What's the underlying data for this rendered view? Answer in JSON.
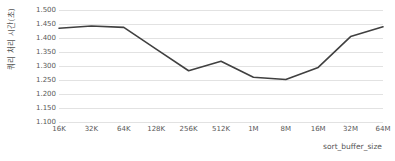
{
  "chart_data": {
    "type": "line",
    "title": "",
    "xlabel": "sort_buffer_size",
    "ylabel": "쿼리 처리 시간(초)",
    "categories": [
      "16K",
      "32K",
      "64K",
      "128K",
      "256K",
      "512K",
      "1M",
      "8M",
      "16M",
      "32M",
      "64M"
    ],
    "values": [
      1.435,
      1.443,
      1.438,
      1.36,
      1.283,
      1.317,
      1.26,
      1.252,
      1.295,
      1.405,
      1.44
    ],
    "series": [
      {
        "name": "쿼리 처리 시간(초)",
        "values": [
          1.435,
          1.443,
          1.438,
          1.36,
          1.283,
          1.317,
          1.26,
          1.252,
          1.295,
          1.405,
          1.44
        ]
      }
    ],
    "ylim": [
      1.1,
      1.5
    ],
    "ytick_step": 0.05,
    "ytick_labels": [
      "1.500",
      "1.450",
      "1.400",
      "1.350",
      "1.300",
      "1.250",
      "1.200",
      "1.150",
      "1.100"
    ],
    "ytick_values": [
      1.5,
      1.45,
      1.4,
      1.35,
      1.3,
      1.25,
      1.2,
      1.15,
      1.1
    ],
    "grid": "horizontal",
    "legend": "none",
    "line_color": "#404040",
    "grid_color": "#e2e2e2",
    "background_color": "#ffffff",
    "text_color": "#595959"
  }
}
